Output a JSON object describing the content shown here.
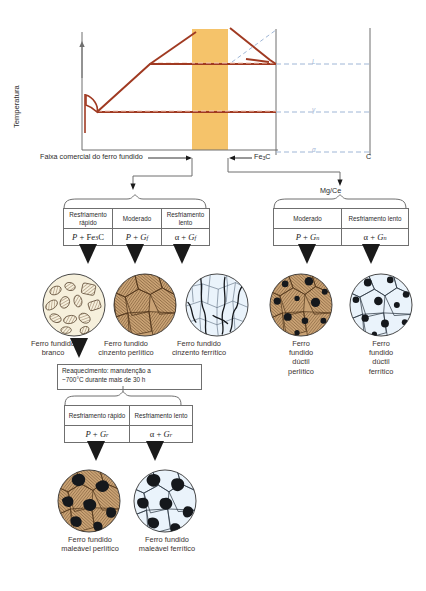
{
  "figure": {
    "language": "pt-BR"
  },
  "diagram": {
    "y_axis_label": "Temperatura",
    "x_right_label": "C",
    "fe3c_label": "Fe3C",
    "commercial_range_label": "Faixa comercial do ferro fundido",
    "dashed_labels": [
      "L",
      "γ",
      "α"
    ],
    "highlight_color": "#f5c36a",
    "line_color": "#a03a22",
    "dashed_color": "#9fb6d6",
    "axis_color": "#6f6f6f"
  },
  "branch_right_label": "Mg/Ce",
  "top_group": {
    "columns": [
      {
        "name": "white-iron",
        "condition": "Resfriamento\nrápido",
        "phases_html": "P + Fe<span class=\"subn\">3</span>C"
      },
      {
        "name": "gray-pearlitic",
        "condition": "Moderado",
        "phases_html": "P + G<span class=\"sub\">f</span>"
      },
      {
        "name": "gray-ferritic",
        "condition": "Resfriamento\nlento",
        "phases_html": "α + G<span class=\"sub\">f</span>"
      }
    ]
  },
  "right_group": {
    "columns": [
      {
        "name": "ductile-pearlitic",
        "condition": "Moderado",
        "phases_html": "P + G<span class=\"sub\">n</span>"
      },
      {
        "name": "ductile-ferritic",
        "condition": "Resfriamento\nlento",
        "phases_html": "α + G<span class=\"sub\">n</span>"
      }
    ]
  },
  "reheat_note": "Reaquecimento: manutenção a\n~700°C durante mais de 30 h",
  "bottom_group": {
    "columns": [
      {
        "name": "malleable-pearlitic",
        "condition": "Resfriamento\nrápido",
        "phases_html": "P + G<span class=\"sub\">r</span>"
      },
      {
        "name": "malleable-ferritic",
        "condition": "Resfriamento\nlento",
        "phases_html": "α + G<span class=\"sub\">r</span>"
      }
    ]
  },
  "micrographs": [
    {
      "name": "white-cast-iron",
      "caption": "Ferro fundido\nbranco",
      "matrix": "#f6f0dc",
      "phase": "#b08a5a"
    },
    {
      "name": "gray-pearlitic-cast-iron",
      "caption": "Ferro fundido\ncinzento perlítico",
      "matrix": "#c9a274",
      "phase": "#6d4a2a"
    },
    {
      "name": "gray-ferritic-cast-iron",
      "caption": "Ferro fundido\ncinzento ferrítico",
      "matrix": "#e9f2fa",
      "phase": "#1d1d1d"
    },
    {
      "name": "ductile-pearlitic-cast-iron",
      "caption": "Ferro\nfundido\ndúctil\nperlítico",
      "matrix": "#c9a274",
      "phase": "#1d1d1d"
    },
    {
      "name": "ductile-ferritic-cast-iron",
      "caption": "Ferro\nfundido\ndúctil\nferrítico",
      "matrix": "#e9f2fa",
      "phase": "#1d1d1d"
    },
    {
      "name": "malleable-pearlitic-cast-iron",
      "caption": "Ferro fundido\nmaleável perlítico",
      "matrix": "#c9a274",
      "phase": "#1d1d1d"
    },
    {
      "name": "malleable-ferritic-cast-iron",
      "caption": "Ferro fundido\nmaleável ferrítico",
      "matrix": "#e9f2fa",
      "phase": "#1d1d1d"
    }
  ]
}
